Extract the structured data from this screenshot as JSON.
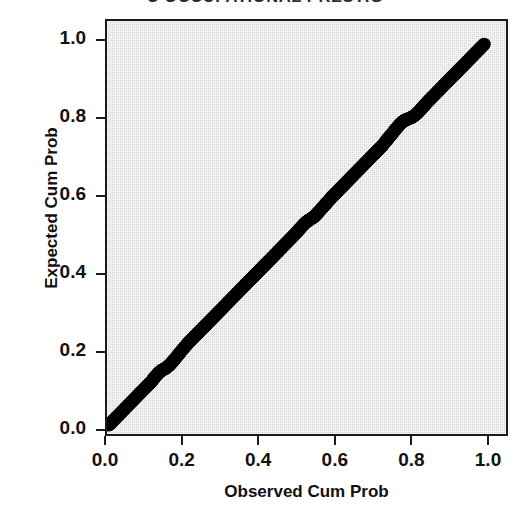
{
  "chart_data": {
    "type": "scatter",
    "title": "C OCCUPATIONAL PRESTIG",
    "subtitle": "",
    "xlabel": "Observed Cum Prob",
    "ylabel": "Expected Cum Prob",
    "xlim": [
      0.0,
      1.0
    ],
    "ylim": [
      0.0,
      1.0
    ],
    "grid": false,
    "legend": null,
    "xticks": [
      "0.0",
      "0.2",
      "0.4",
      "0.6",
      "0.8",
      "1.0"
    ],
    "yticks": [
      "0.0",
      "0.2",
      "0.4",
      "0.6",
      "0.8",
      "1.0"
    ],
    "xtick_values": [
      0.0,
      0.2,
      0.4,
      0.6,
      0.8,
      1.0
    ],
    "ytick_values": [
      0.0,
      0.2,
      0.4,
      0.6,
      0.8,
      1.0
    ],
    "series": [
      {
        "name": "Normal P-P plot points",
        "marker": "filled-circle",
        "color": "#000000",
        "marker_size": 13,
        "x": [
          0.005,
          0.015,
          0.025,
          0.035,
          0.045,
          0.055,
          0.065,
          0.075,
          0.085,
          0.095,
          0.105,
          0.115,
          0.125,
          0.135,
          0.145,
          0.155,
          0.165,
          0.175,
          0.185,
          0.195,
          0.205,
          0.215,
          0.225,
          0.235,
          0.245,
          0.255,
          0.265,
          0.275,
          0.285,
          0.295,
          0.305,
          0.315,
          0.325,
          0.335,
          0.345,
          0.355,
          0.365,
          0.375,
          0.385,
          0.395,
          0.405,
          0.415,
          0.425,
          0.435,
          0.445,
          0.455,
          0.465,
          0.475,
          0.485,
          0.495,
          0.505,
          0.515,
          0.525,
          0.535,
          0.545,
          0.555,
          0.565,
          0.575,
          0.585,
          0.595,
          0.605,
          0.615,
          0.625,
          0.635,
          0.645,
          0.655,
          0.665,
          0.675,
          0.685,
          0.695,
          0.705,
          0.715,
          0.725,
          0.735,
          0.745,
          0.755,
          0.765,
          0.775,
          0.785,
          0.795,
          0.805,
          0.815,
          0.825,
          0.835,
          0.845,
          0.855,
          0.865,
          0.875,
          0.885,
          0.895,
          0.905,
          0.915,
          0.925,
          0.935,
          0.945,
          0.955,
          0.965,
          0.975,
          0.985,
          0.995
        ],
        "y": [
          0.008,
          0.018,
          0.028,
          0.038,
          0.048,
          0.058,
          0.068,
          0.078,
          0.088,
          0.098,
          0.108,
          0.118,
          0.13,
          0.142,
          0.15,
          0.155,
          0.163,
          0.174,
          0.186,
          0.198,
          0.21,
          0.221,
          0.231,
          0.241,
          0.251,
          0.261,
          0.271,
          0.281,
          0.291,
          0.301,
          0.311,
          0.321,
          0.331,
          0.341,
          0.351,
          0.361,
          0.371,
          0.381,
          0.391,
          0.401,
          0.411,
          0.421,
          0.431,
          0.441,
          0.451,
          0.461,
          0.471,
          0.481,
          0.491,
          0.501,
          0.512,
          0.523,
          0.533,
          0.54,
          0.546,
          0.556,
          0.567,
          0.578,
          0.589,
          0.6,
          0.61,
          0.62,
          0.63,
          0.64,
          0.65,
          0.66,
          0.67,
          0.68,
          0.69,
          0.7,
          0.71,
          0.72,
          0.73,
          0.742,
          0.754,
          0.766,
          0.778,
          0.789,
          0.797,
          0.801,
          0.805,
          0.812,
          0.822,
          0.833,
          0.844,
          0.854,
          0.864,
          0.874,
          0.884,
          0.894,
          0.904,
          0.914,
          0.924,
          0.934,
          0.944,
          0.954,
          0.964,
          0.974,
          0.984,
          0.994
        ]
      }
    ],
    "colors": {
      "plot_background": "#d9d9d9",
      "page_background": "#ffffff",
      "frame": "#1a1a1a",
      "marker": "#000000",
      "text": "#111111"
    }
  }
}
